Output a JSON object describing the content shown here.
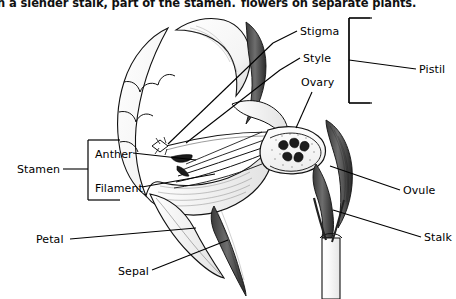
{
  "page": {
    "width": 456,
    "height": 299,
    "background": "#ffffff",
    "ink": "#000000"
  },
  "captions": {
    "left_partial": "n a slender stalk, part of the stamen.",
    "right_partial": "flowers on separate plants."
  },
  "labels": {
    "stigma": "Stigma",
    "style": "Style",
    "ovary": "Ovary",
    "pistil": "Pistil",
    "stamen": "Stamen",
    "anther": "Anther",
    "filament": "Filament",
    "petal": "Petal",
    "sepal": "Sepal",
    "ovule": "Ovule",
    "stalk": "Stalk"
  },
  "brackets": {
    "pistil_groups": [
      "Stigma",
      "Style",
      "Ovary"
    ],
    "stamen_groups": [
      "Anther",
      "Filament"
    ]
  }
}
